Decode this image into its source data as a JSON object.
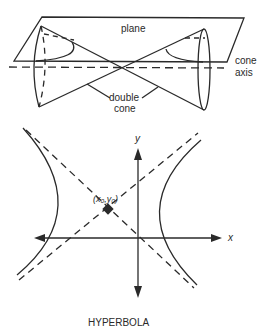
{
  "top_figure": {
    "name": "cone and plane",
    "labels": {
      "plane": "plane",
      "cone_axis_line1": "cone",
      "cone_axis_line2": "axis",
      "double_cone_line1": "double",
      "double_cone_line2": "cone"
    }
  },
  "bottom_figure": {
    "title": "HYPERBOLA",
    "x_axis_label": "x",
    "y_axis_label": "y",
    "center_label": "(x₀,y₀)"
  },
  "colors": {
    "ink": "#2a2a2a",
    "background": "#ffffff"
  }
}
